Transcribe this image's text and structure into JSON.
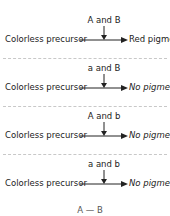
{
  "diagram": {
    "rows": [
      {
        "enzymes": "A and B",
        "substrate": "Colorless precursor",
        "product": "Red pigment"
      },
      {
        "enzymes": "a and B",
        "substrate": "Colorless precursor",
        "product": "No pigment"
      },
      {
        "enzymes": "A and b",
        "substrate": "Colorless precursor",
        "product": "No pigment"
      },
      {
        "enzymes": "a and b",
        "substrate": "Colorless precursor",
        "product": "No pigment"
      }
    ],
    "partial_label": "A — B",
    "icons": {
      "down_arrow": "arrow-down-icon",
      "right_arrow": "arrow-right-icon"
    },
    "colors": {
      "text": "#222222",
      "separator": "#c8c8c8"
    }
  }
}
